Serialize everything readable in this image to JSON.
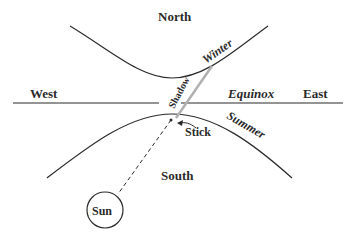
{
  "labels": {
    "north": "North",
    "south": "South",
    "west": "West",
    "east": "East",
    "equinox": "Equinox",
    "winter": "Winter",
    "summer": "Summer",
    "shadow": "Shadow",
    "stick": "Stick",
    "sun": "Sun"
  },
  "colors": {
    "line": "#2b2b2b",
    "shadow": "#b0b0b0",
    "background": "#ffffff"
  }
}
